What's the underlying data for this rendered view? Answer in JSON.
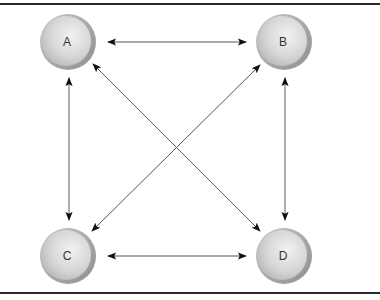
{
  "diagram": {
    "type": "fully-connected-graph",
    "nodes": [
      {
        "id": "A",
        "label": "A",
        "cx": 68,
        "cy": 42
      },
      {
        "id": "B",
        "label": "B",
        "cx": 284,
        "cy": 42
      },
      {
        "id": "C",
        "label": "C",
        "cx": 68,
        "cy": 256
      },
      {
        "id": "D",
        "label": "D",
        "cx": 284,
        "cy": 256
      }
    ],
    "edges": [
      {
        "from": "A",
        "to": "B",
        "direction": "bidirectional"
      },
      {
        "from": "A",
        "to": "C",
        "direction": "bidirectional"
      },
      {
        "from": "A",
        "to": "D",
        "direction": "bidirectional"
      },
      {
        "from": "B",
        "to": "C",
        "direction": "bidirectional"
      },
      {
        "from": "B",
        "to": "D",
        "direction": "bidirectional"
      },
      {
        "from": "C",
        "to": "D",
        "direction": "bidirectional"
      }
    ],
    "colors": {
      "node_fill_light": "#e6e6e6",
      "node_fill_dark": "#a8a8a8",
      "node_rim": "#9a9a9a",
      "edge": "#555555",
      "arrowhead": "#111111",
      "frame": "#2a2a2a"
    }
  }
}
